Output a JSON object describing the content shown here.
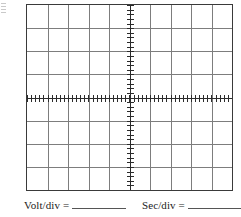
{
  "sheet": {
    "title": "Oscilloscope graticule worksheet",
    "background_color": "#ffffff"
  },
  "graticule": {
    "name": "oscilloscope-graticule",
    "columns": 10,
    "rows": 8,
    "border_color": "#3a3a3a",
    "gridline_color": "#7d7d7d",
    "axis_color": "#2b2b2b",
    "division_width_px": 20.7,
    "division_height_px": 23.4,
    "ticks_per_division": 5,
    "vertical_axis_ticks": 40,
    "horizontal_axis_ticks": 50,
    "center_x_division": 5,
    "center_y_division": 4
  },
  "labels": {
    "volt": {
      "text": "Volt/div =",
      "blank_value": ""
    },
    "sec": {
      "text": "Sec/div =",
      "blank_value": ""
    }
  },
  "chart_data": {
    "type": "table",
    "xlabel": "Sec/div",
    "ylabel": "Volt/div",
    "categories": [],
    "values": [],
    "grid": true,
    "xlim": [
      -5,
      5
    ],
    "ylim": [
      -4,
      4
    ]
  }
}
